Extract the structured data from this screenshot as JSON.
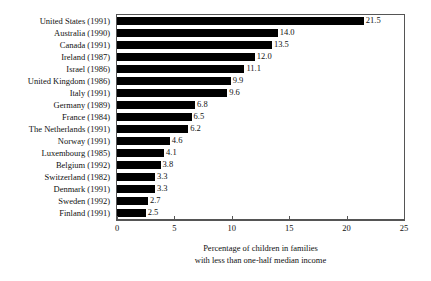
{
  "chart_data": {
    "type": "bar",
    "orientation": "horizontal",
    "title": "",
    "subtitle": "",
    "xlabel": "Percentage of children in families with less than one-half median income",
    "xlabel_lines": [
      "Percentage of children in families",
      "with less than one-half median income"
    ],
    "ylabel": "",
    "xlim": [
      0,
      25
    ],
    "xticks": [
      0,
      5,
      10,
      15,
      20,
      25
    ],
    "xtick_labels": [
      "0",
      "5",
      "10",
      "15",
      "20",
      "25"
    ],
    "grid": false,
    "legend": null,
    "bar_color": "#000000",
    "frame_color": "#555555",
    "background_color": "#ffffff",
    "categories": [
      "United States (1991)",
      "Australia (1990)",
      "Canada (1991)",
      "Ireland (1987)",
      "Israel (1986)",
      "United Kingdom (1986)",
      "Italy (1991)",
      "Germany (1989)",
      "France (1984)",
      "The Netherlands (1991)",
      "Norway (1991)",
      "Luxembourg (1985)",
      "Belgium (1992)",
      "Switzerland (1982)",
      "Denmark (1991)",
      "Sweden (1992)",
      "Finland (1991)"
    ],
    "values": [
      21.5,
      14.0,
      13.5,
      12.0,
      11.1,
      9.9,
      9.6,
      6.8,
      6.5,
      6.2,
      4.6,
      4.1,
      3.8,
      3.3,
      3.3,
      2.7,
      2.5
    ],
    "value_labels": [
      "21.5",
      "14.0",
      "13.5",
      "12.0",
      "11.1",
      "9.9",
      "9.6",
      "6.8",
      "6.5",
      "6.2",
      "4.6",
      "4.1",
      "3.8",
      "3.3",
      "3.3",
      "2.7",
      "2.5"
    ]
  }
}
